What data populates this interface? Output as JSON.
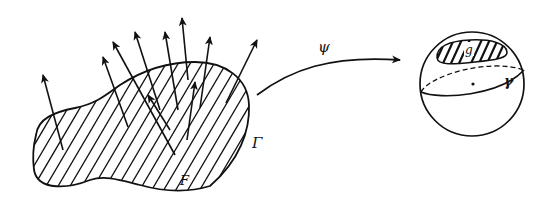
{
  "diagram": {
    "labels": {
      "boundary": "Γ",
      "region": "F",
      "map": "ψ",
      "image_region": "g",
      "image_curve": "γ"
    },
    "colors": {
      "ink": "#111111",
      "background": "#ffffff"
    }
  }
}
